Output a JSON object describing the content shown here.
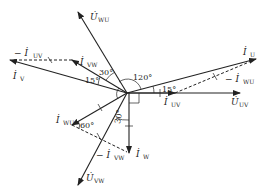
{
  "diagram": {
    "type": "phasor",
    "origin": [
      127,
      93
    ],
    "phasors": [
      {
        "id": "U_UV",
        "symbol": "U",
        "dot": true,
        "sub": "UV",
        "end": [
          240,
          93
        ],
        "style": "solid"
      },
      {
        "id": "U_WU",
        "symbol": "U",
        "dot": true,
        "sub": "WU",
        "end": [
          78,
          12
        ],
        "style": "solid"
      },
      {
        "id": "U_VW",
        "symbol": "U",
        "dot": true,
        "sub": "VW",
        "end": [
          78,
          185
        ],
        "style": "solid"
      },
      {
        "id": "I_U",
        "symbol": "I",
        "dot": true,
        "sub": "U",
        "end": [
          256,
          59
        ],
        "style": "solid"
      },
      {
        "id": "I_V",
        "symbol": "I",
        "dot": true,
        "sub": "V",
        "end": [
          10,
          60
        ],
        "style": "solid"
      },
      {
        "id": "I_W",
        "symbol": "I",
        "dot": true,
        "sub": "W",
        "end": [
          129,
          153
        ],
        "style": "solid"
      },
      {
        "id": "I_UV",
        "symbol": "I",
        "dot": true,
        "sub": "UV",
        "end": [
          175,
          93
        ],
        "style": "solid"
      },
      {
        "id": "I_VW",
        "symbol": "I",
        "dot": true,
        "sub": "VW",
        "end": [
          72,
          60
        ],
        "style": "solid"
      },
      {
        "id": "I_WU",
        "symbol": "I",
        "dot": true,
        "sub": "WU",
        "end": [
          72,
          125
        ],
        "style": "solid"
      }
    ],
    "labels": {
      "U_UV": {
        "main": "U̇",
        "sub": "UV"
      },
      "U_WU": {
        "main": "U̇",
        "sub": "WU"
      },
      "U_VW": {
        "main": "U̇",
        "sub": "VW"
      },
      "I_U": {
        "main": "İ",
        "sub": "U"
      },
      "I_V": {
        "main": "İ",
        "sub": "V"
      },
      "I_W": {
        "main": "İ",
        "sub": "W"
      },
      "I_UV": {
        "main": "İ",
        "sub": "UV"
      },
      "I_VW": {
        "main": "İ",
        "sub": "VW"
      },
      "I_WU": {
        "main": "İ",
        "sub": "WU"
      },
      "neg_I_UV": {
        "main": "− İ",
        "sub": "UV"
      },
      "neg_I_WU": {
        "main": "− İ",
        "sub": "WU"
      },
      "neg_I_VW": {
        "main": "− İ",
        "sub": "VW"
      }
    },
    "angles": {
      "a120": "120°",
      "a30_top": "30°",
      "a15_left": "15°",
      "a15_right": "15°",
      "a60": "60°",
      "a30_bottom": "30°"
    },
    "dashed_lines": [
      {
        "id": "neg_I_UV",
        "from": [
          72,
          60
        ],
        "to": [
          10,
          60
        ]
      },
      {
        "id": "neg_I_WU",
        "from": [
          175,
          93
        ],
        "to": [
          256,
          59
        ]
      },
      {
        "id": "neg_I_VW",
        "from": [
          72,
          125
        ],
        "to": [
          129,
          153
        ]
      }
    ]
  }
}
